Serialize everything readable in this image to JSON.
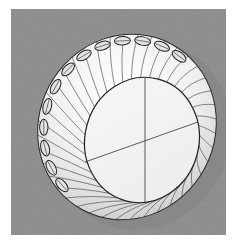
{
  "viewport": {
    "name": "Perspective",
    "display_mode": "shaded",
    "x": 11,
    "y": 9,
    "width": 215,
    "height": 226,
    "background_color": "#8e8e8e",
    "grid_color": "#999999"
  },
  "model": {
    "type": "tire-torus-with-scalloped-rim",
    "surface_color": "#f2f2f2",
    "shadow_color": "#bcbcbc",
    "edge_color": "#2a2a2a",
    "outer": {
      "cx": 127,
      "cy": 127,
      "rx": 88,
      "ry": 94,
      "rotate": 28
    },
    "inner": {
      "cx": 142,
      "cy": 140,
      "rx": 57,
      "ry": 63,
      "rotate": 15
    },
    "axis_lines": [
      {
        "x1": 145,
        "y1": 78,
        "x2": 145,
        "y2": 202
      },
      {
        "x1": 85,
        "y1": 162,
        "x2": 198,
        "y2": 122
      }
    ],
    "isocurve_count": 40,
    "scallop_count": 13
  }
}
